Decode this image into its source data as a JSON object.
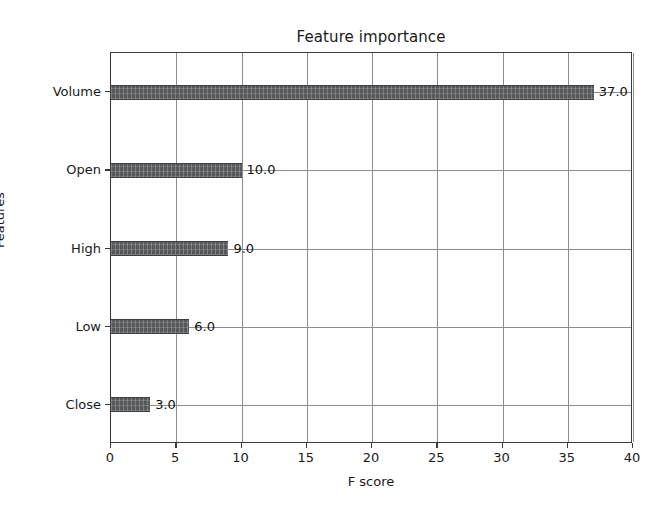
{
  "chart_data": {
    "type": "bar",
    "orientation": "horizontal",
    "title": "Feature importance",
    "xlabel": "F score",
    "ylabel": "Features",
    "categories": [
      "Close",
      "Low",
      "High",
      "Open",
      "Volume"
    ],
    "values": [
      3.0,
      6.0,
      9.0,
      10.0,
      37.0
    ],
    "value_labels": [
      "3.0",
      "6.0",
      "9.0",
      "10.0",
      "37.0"
    ],
    "xlim": [
      0,
      40
    ],
    "xticks": [
      0,
      5,
      10,
      15,
      20,
      25,
      30,
      35,
      40
    ],
    "xtick_labels": [
      "0",
      "5",
      "10",
      "15",
      "20",
      "25",
      "30",
      "35",
      "40"
    ],
    "grid": true,
    "legend": null,
    "bar_color": "#56585a",
    "grid_color": "#8d8d8d",
    "axis_color": "#3a3a3a",
    "background": "#ffffff"
  },
  "figure": {
    "title": "Feature importance",
    "axis": {
      "x_label": "F score",
      "y_label": "Features"
    }
  }
}
